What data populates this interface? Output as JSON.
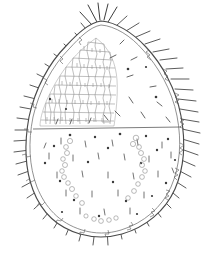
{
  "figure": {
    "medium": "ink line drawing, grayscale scan",
    "background_color": "#ffffff",
    "line_color": "#4a4a4a",
    "detail_color": "#8a8a8a",
    "caption": "",
    "has_text_labels": false
  },
  "canvas": {
    "width": 211,
    "height": 256
  },
  "body": {
    "name": "idiosoma-outline",
    "shape": "ovoid, tapering to rounded apex at top, broadly rounded at base",
    "apex_x": 101,
    "apex_y": 21,
    "base_y": 238,
    "widest_y": 150,
    "left_x": 30,
    "right_x": 182,
    "outline_style": "double line: outer margin plus thin inner parallel line"
  },
  "median_line": {
    "name": "transverse-median-line",
    "y": 128,
    "x_start": 32,
    "x_end": 181,
    "description": "horizontal suture dividing propodosoma from hysterosoma"
  },
  "reticulate_patch": {
    "name": "dorsal-shield-reticulation",
    "region": "upper-left quadrant",
    "cell_count_estimate": 120,
    "cell_shape": "irregular polygonal",
    "bounds": {
      "x": 40,
      "y": 40,
      "width": 78,
      "height": 86
    }
  },
  "marginal_spines": {
    "name": "marginal-setae",
    "count": 46,
    "length_range_px": [
      7,
      17
    ],
    "apex_cluster_count": 5,
    "apex_cluster_length_px": 20,
    "description": "stiff spine-like setae projecting radially from body margin"
  },
  "dorsal_setae": {
    "name": "dorsal-setae",
    "count": 34,
    "description": "short curved setae scattered over dorsum, denser in lower half"
  },
  "pore_chains": {
    "name": "lateral-pore-chains",
    "count": 2,
    "side_labels": [
      "left",
      "right"
    ],
    "ring_count_per_chain": 11,
    "description": "vertical paired chains of small circular pores in lower half"
  },
  "pores": {
    "name": "dorsal-pores",
    "count": 26,
    "description": "solid dark punctations scattered across the dorsum"
  }
}
